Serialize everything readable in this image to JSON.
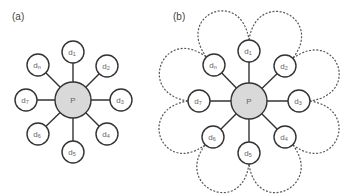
{
  "panels": [
    {
      "id": "a",
      "label": "(a)",
      "label_pos": [
        12,
        20
      ],
      "hub": {
        "label": "P",
        "cx": 73,
        "cy": 100,
        "r": 18
      },
      "node_r": 11,
      "nodes": [
        {
          "base": "d",
          "sub": "1",
          "cx": 73,
          "cy": 52
        },
        {
          "base": "d",
          "sub": "2",
          "cx": 107,
          "cy": 66
        },
        {
          "base": "d",
          "sub": "3",
          "cx": 121,
          "cy": 100
        },
        {
          "base": "d",
          "sub": "4",
          "cx": 107,
          "cy": 134
        },
        {
          "base": "d",
          "sub": "5",
          "cx": 73,
          "cy": 152
        },
        {
          "base": "d",
          "sub": "6",
          "cx": 38,
          "cy": 134
        },
        {
          "base": "d",
          "sub": "7",
          "cx": 26,
          "cy": 100
        },
        {
          "base": "d",
          "sub": "n",
          "cx": 38,
          "cy": 65
        }
      ],
      "loops": false
    },
    {
      "id": "b",
      "label": "(b)",
      "label_pos": [
        173,
        20
      ],
      "hub": {
        "label": "P",
        "cx": 249,
        "cy": 101,
        "r": 18
      },
      "node_r": 11,
      "nodes": [
        {
          "base": "d",
          "sub": "1",
          "cx": 249,
          "cy": 51
        },
        {
          "base": "d",
          "sub": "2",
          "cx": 285,
          "cy": 66
        },
        {
          "base": "d",
          "sub": "3",
          "cx": 299,
          "cy": 101
        },
        {
          "base": "d",
          "sub": "4",
          "cx": 285,
          "cy": 137
        },
        {
          "base": "d",
          "sub": "5",
          "cx": 249,
          "cy": 153
        },
        {
          "base": "d",
          "sub": "6",
          "cx": 213,
          "cy": 137
        },
        {
          "base": "d",
          "sub": "7",
          "cx": 199,
          "cy": 101
        },
        {
          "base": "d",
          "sub": "n",
          "cx": 214,
          "cy": 65
        }
      ],
      "loops": true
    }
  ],
  "colors": {
    "stroke": "#333333",
    "hub_fill": "#d9d9d9",
    "node_fill": "#ffffff",
    "dashed": "#555555",
    "label": "#666666"
  }
}
